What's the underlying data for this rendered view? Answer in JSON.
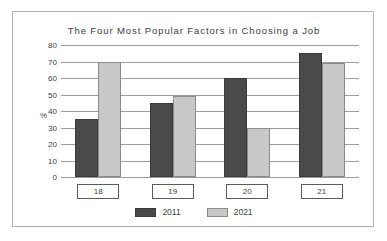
{
  "chart_data": {
    "type": "bar",
    "title": "The Four Most Popular Factors in Choosing a Job",
    "categories": [
      "18",
      "19",
      "20",
      "21"
    ],
    "series": [
      {
        "name": "2011",
        "color": "#4a4a4a",
        "values": [
          35,
          45,
          60,
          75
        ]
      },
      {
        "name": "2021",
        "color": "#c8c8c8",
        "values": [
          70,
          49,
          30,
          69
        ]
      }
    ],
    "xlabel": "",
    "ylabel": "%",
    "ylim": [
      0,
      80
    ],
    "yticks": [
      80,
      70,
      60,
      50,
      40,
      30,
      20,
      10,
      0
    ],
    "ytick_labels": [
      "80",
      "70",
      "60",
      "50",
      "40",
      "30",
      "20",
      "10",
      "0"
    ],
    "grid": true,
    "legend_position": "bottom"
  },
  "style": {
    "series_colors": [
      "#4a4a4a",
      "#c8c8c8"
    ],
    "grid_color": "#9a9a9a",
    "frame_color": "#b4b4b4",
    "text_color": "#3c3c3c",
    "background": "#ffffff"
  }
}
